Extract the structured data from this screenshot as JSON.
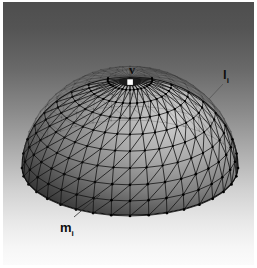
{
  "figure": {
    "background": {
      "top_color": "#4e4e4e",
      "bottom_color": "#fbfbfb",
      "border_color": "#ffffff"
    }
  },
  "labels": {
    "apex": {
      "text": "v",
      "symbol": "v",
      "subscript": ""
    },
    "edge": {
      "text": "l",
      "symbol": "l",
      "subscript": "i"
    },
    "element": {
      "text": "m",
      "symbol": "m",
      "subscript": "i"
    }
  },
  "mesh": {
    "name": "dome-mesh",
    "type": "triangulated-hemisphere",
    "radial_divisions": 36,
    "ring_divisions": 9,
    "edge_color": "#151515",
    "vertex_color": "#000000",
    "apex_marker_color": "#ffffff",
    "center_x": 130,
    "center_y": 168,
    "radius_x": 108,
    "radius_y": 48,
    "apex_x": 130,
    "apex_y": 78,
    "height": 90
  },
  "leaders": {
    "element_leader": {
      "from_x": 74,
      "from_y": 217,
      "to_x": 99,
      "to_y": 196
    },
    "edge_leader": {
      "from_x": 221,
      "from_y": 82,
      "to_x": 208,
      "to_y": 95
    }
  }
}
